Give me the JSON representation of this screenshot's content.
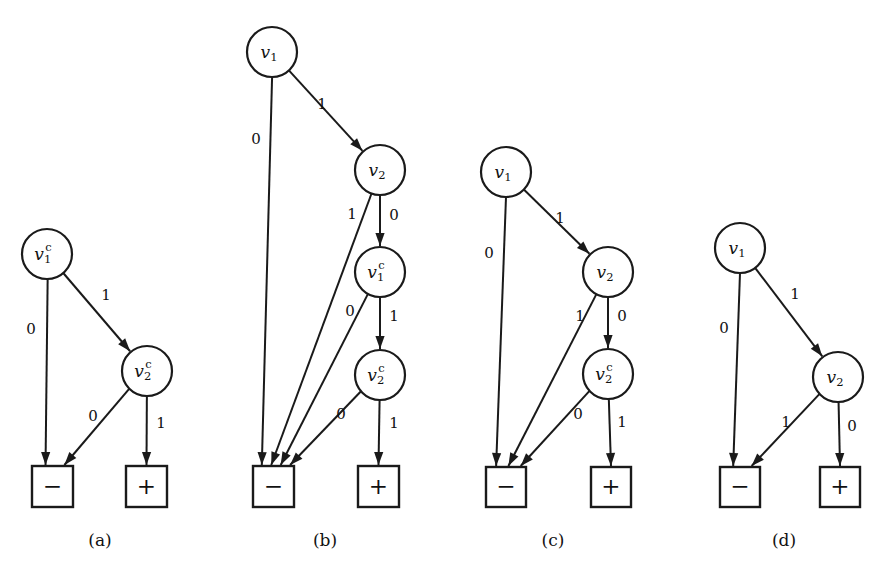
{
  "figure": {
    "background": "#ffffff",
    "ink_color": "#1a1a1a",
    "panels": [
      {
        "id": "a",
        "caption": "(a)",
        "caption_x": 100,
        "caption_y": 541,
        "nodes": [
          {
            "id": "v1c",
            "base": "v",
            "sub": "1",
            "sup": "c",
            "cx": 47,
            "cy": 254,
            "r": 25
          },
          {
            "id": "v2c",
            "base": "v",
            "sub": "2",
            "sup": "c",
            "cx": 147,
            "cy": 371,
            "r": 25
          }
        ],
        "terminals": [
          {
            "id": "neg",
            "glyph": "−",
            "x": 32,
            "y": 466,
            "w": 41,
            "h": 41
          },
          {
            "id": "pos",
            "glyph": "+",
            "x": 126,
            "y": 466,
            "w": 41,
            "h": 41
          }
        ],
        "edges": [
          {
            "from": "v1c",
            "to": "neg",
            "label": "0",
            "lx": 31,
            "ly": 330
          },
          {
            "from": "v1c",
            "to": "v2c",
            "label": "1",
            "lx": 106,
            "ly": 296
          },
          {
            "from": "v2c",
            "to": "neg",
            "label": "0",
            "lx": 93,
            "ly": 417
          },
          {
            "from": "v2c",
            "to": "pos",
            "label": "1",
            "lx": 161,
            "ly": 424
          }
        ]
      },
      {
        "id": "b",
        "caption": "(b)",
        "caption_x": 325,
        "caption_y": 541,
        "nodes": [
          {
            "id": "v1",
            "base": "v",
            "sub": "1",
            "sup": "",
            "cx": 272,
            "cy": 52,
            "r": 25
          },
          {
            "id": "v2",
            "base": "v",
            "sub": "2",
            "sup": "",
            "cx": 380,
            "cy": 170,
            "r": 25
          },
          {
            "id": "v1c",
            "base": "v",
            "sub": "1",
            "sup": "c",
            "cx": 380,
            "cy": 272,
            "r": 25
          },
          {
            "id": "v2c",
            "base": "v",
            "sub": "2",
            "sup": "c",
            "cx": 380,
            "cy": 375,
            "r": 25
          }
        ],
        "terminals": [
          {
            "id": "neg",
            "glyph": "−",
            "x": 253,
            "y": 466,
            "w": 41,
            "h": 41
          },
          {
            "id": "pos",
            "glyph": "+",
            "x": 358,
            "y": 466,
            "w": 41,
            "h": 41
          }
        ],
        "edges": [
          {
            "from": "v1",
            "to": "neg",
            "label": "0",
            "lx": 256,
            "ly": 140
          },
          {
            "from": "v1",
            "to": "v2",
            "label": "1",
            "lx": 322,
            "ly": 105
          },
          {
            "from": "v2",
            "to": "neg",
            "label": "1",
            "lx": 352,
            "ly": 215
          },
          {
            "from": "v2",
            "to": "v1c",
            "label": "0",
            "lx": 394,
            "ly": 216
          },
          {
            "from": "v1c",
            "to": "neg",
            "label": "0",
            "lx": 350,
            "ly": 312
          },
          {
            "from": "v1c",
            "to": "v2c",
            "label": "1",
            "lx": 394,
            "ly": 317
          },
          {
            "from": "v2c",
            "to": "neg",
            "label": "0",
            "lx": 341,
            "ly": 415
          },
          {
            "from": "v2c",
            "to": "pos",
            "label": "1",
            "lx": 394,
            "ly": 424
          }
        ]
      },
      {
        "id": "c",
        "caption": "(c)",
        "caption_x": 553,
        "caption_y": 541,
        "nodes": [
          {
            "id": "v1",
            "base": "v",
            "sub": "1",
            "sup": "",
            "cx": 506,
            "cy": 172,
            "r": 25
          },
          {
            "id": "v2",
            "base": "v",
            "sub": "2",
            "sup": "",
            "cx": 608,
            "cy": 272,
            "r": 25
          },
          {
            "id": "v2c",
            "base": "v",
            "sub": "2",
            "sup": "c",
            "cx": 608,
            "cy": 374,
            "r": 25
          }
        ],
        "terminals": [
          {
            "id": "neg",
            "glyph": "−",
            "x": 486,
            "y": 467,
            "w": 40,
            "h": 40
          },
          {
            "id": "pos",
            "glyph": "+",
            "x": 591,
            "y": 467,
            "w": 40,
            "h": 40
          }
        ],
        "edges": [
          {
            "from": "v1",
            "to": "neg",
            "label": "0",
            "lx": 489,
            "ly": 254
          },
          {
            "from": "v1",
            "to": "v2",
            "label": "1",
            "lx": 560,
            "ly": 219
          },
          {
            "from": "v2",
            "to": "neg",
            "label": "1",
            "lx": 580,
            "ly": 317
          },
          {
            "from": "v2",
            "to": "v2c",
            "label": "0",
            "lx": 622,
            "ly": 317
          },
          {
            "from": "v2c",
            "to": "neg",
            "label": "0",
            "lx": 578,
            "ly": 415
          },
          {
            "from": "v2c",
            "to": "pos",
            "label": "1",
            "lx": 622,
            "ly": 423
          }
        ]
      },
      {
        "id": "d",
        "caption": "(d)",
        "caption_x": 784,
        "caption_y": 541,
        "nodes": [
          {
            "id": "v1",
            "base": "v",
            "sub": "1",
            "sup": "",
            "cx": 740,
            "cy": 248,
            "r": 25
          },
          {
            "id": "v2",
            "base": "v",
            "sub": "2",
            "sup": "",
            "cx": 838,
            "cy": 377,
            "r": 25
          }
        ],
        "terminals": [
          {
            "id": "neg",
            "glyph": "−",
            "x": 720,
            "y": 467,
            "w": 40,
            "h": 40
          },
          {
            "id": "pos",
            "glyph": "+",
            "x": 820,
            "y": 467,
            "w": 40,
            "h": 40
          }
        ],
        "edges": [
          {
            "from": "v1",
            "to": "neg",
            "label": "0",
            "lx": 724,
            "ly": 329
          },
          {
            "from": "v1",
            "to": "v2",
            "label": "1",
            "lx": 795,
            "ly": 295
          },
          {
            "from": "v2",
            "to": "neg",
            "label": "1",
            "lx": 786,
            "ly": 423
          },
          {
            "from": "v2",
            "to": "pos",
            "label": "0",
            "lx": 852,
            "ly": 427
          }
        ]
      }
    ]
  }
}
